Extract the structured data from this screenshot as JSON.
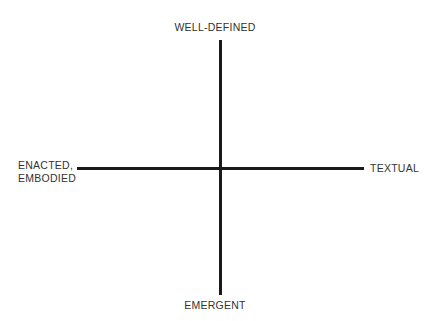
{
  "diagram": {
    "type": "two-axis-quadrant-framework",
    "background_color": "#ffffff",
    "axis_color": "#1a1a1a",
    "label_color": "#333333",
    "vertical_axis": {
      "name": "definition-axis",
      "top_pole": "WELL-DEFINED",
      "bottom_pole": "EMERGENT"
    },
    "horizontal_axis": {
      "name": "modality-axis",
      "left_pole_line1": "ENACTED,",
      "left_pole_line2": "EMBODIED",
      "right_pole": "TEXTUAL"
    }
  }
}
